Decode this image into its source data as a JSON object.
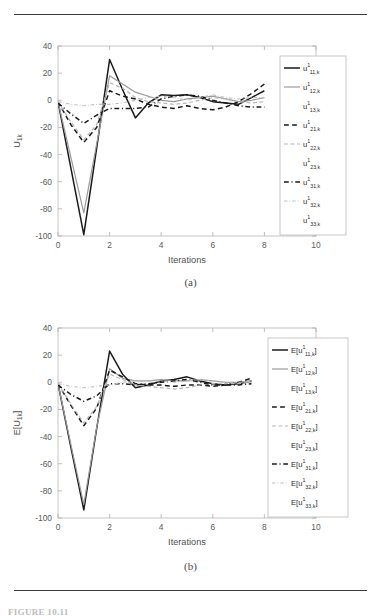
{
  "page": {
    "number_faint": "",
    "figure_caption_cut": "FIGURE 10.11"
  },
  "panels": [
    {
      "id": "a",
      "caption": "(a)"
    },
    {
      "id": "b",
      "caption": "(b)"
    }
  ],
  "chart_data": [
    {
      "type": "line",
      "panel": "a",
      "title": "",
      "xlabel": "Iterations",
      "ylabel": "U_1k",
      "ylabel_text": "U",
      "ylabel_sub": "1k",
      "xlim": [
        0,
        10
      ],
      "ylim": [
        -100,
        40
      ],
      "xticks": [
        0,
        2,
        4,
        6,
        8,
        10
      ],
      "xticklabels": [
        "0",
        "2",
        "4",
        "6",
        "8",
        "10"
      ],
      "yticks": [
        40,
        20,
        0,
        -20,
        -40,
        -60,
        -80,
        -100
      ],
      "yticklabels": [
        "40",
        "20",
        "0",
        "-20",
        "-40",
        "-60",
        "-80",
        "-100"
      ],
      "grid": false,
      "legend_position": "right-inside",
      "x": [
        0,
        0.5,
        1,
        1.5,
        2,
        2.5,
        3,
        3.5,
        4,
        4.5,
        5,
        5.5,
        6,
        6.5,
        7,
        7.5,
        8
      ],
      "series": [
        {
          "name": "u_11k",
          "base": "u",
          "sup": "1",
          "sub": "11,k",
          "style": "solid",
          "color": "#1a1a1a",
          "width": 1.5,
          "values": [
            -1,
            -50,
            -99,
            -35,
            30,
            8,
            -13,
            -2,
            4,
            3.5,
            4,
            2,
            -1,
            -2,
            -3,
            2,
            7
          ]
        },
        {
          "name": "u_12k",
          "base": "u",
          "sup": "1",
          "sub": "12,k",
          "style": "solid",
          "color": "#9a9a9a",
          "width": 1.2,
          "values": [
            -1,
            -42,
            -83,
            -32,
            18,
            12,
            6,
            3,
            0,
            -1,
            1,
            2,
            3,
            1,
            -1,
            0,
            2
          ]
        },
        {
          "name": "u_13k",
          "base": "u",
          "sup": "1",
          "sub": "13,k",
          "style": "none",
          "color": "#ffffff",
          "width": 0,
          "values": [
            0,
            0,
            0,
            0,
            0,
            0,
            0,
            0,
            0,
            0,
            0,
            0,
            0,
            0,
            0,
            0,
            0
          ]
        },
        {
          "name": "u_21k",
          "base": "u",
          "sup": "1",
          "sub": "21,k",
          "style": "dashed",
          "color": "#1a1a1a",
          "width": 1.5,
          "values": [
            -1,
            -18,
            -31,
            -20,
            7,
            3,
            1,
            -3,
            -5,
            -6,
            -4,
            -6,
            -7,
            -5,
            -1,
            5,
            12
          ]
        },
        {
          "name": "u_22k",
          "base": "u",
          "sup": "1",
          "sub": "22,k",
          "style": "dashed",
          "color": "#b6b6b6",
          "width": 1.2,
          "values": [
            -1,
            -16,
            -29,
            -18,
            13,
            9,
            2,
            -1,
            -2,
            -3,
            -2,
            0,
            2,
            1,
            -1,
            -2,
            -1
          ]
        },
        {
          "name": "u_23k",
          "base": "u",
          "sup": "1",
          "sub": "23,k",
          "style": "none",
          "color": "#ffffff",
          "width": 0,
          "values": [
            0,
            0,
            0,
            0,
            0,
            0,
            0,
            0,
            0,
            0,
            0,
            0,
            0,
            0,
            0,
            0,
            0
          ]
        },
        {
          "name": "u_31k",
          "base": "u",
          "sup": "1",
          "sub": "31,k",
          "style": "dashdot",
          "color": "#1a1a1a",
          "width": 1.5,
          "values": [
            -2,
            -10,
            -17,
            -11,
            -6,
            -6,
            -6,
            -5,
            1,
            3,
            4,
            3,
            0,
            -2,
            -4,
            -5,
            -5
          ]
        },
        {
          "name": "u_32k",
          "base": "u",
          "sup": "1",
          "sub": "32,k",
          "style": "dashdot",
          "color": "#c0c0c0",
          "width": 1.1,
          "values": [
            -1,
            -3,
            -4,
            -3,
            -3,
            -2,
            0,
            2,
            3,
            2,
            0,
            2,
            4,
            2,
            1,
            2,
            2
          ]
        },
        {
          "name": "u_33k",
          "base": "u",
          "sup": "1",
          "sub": "33,k",
          "style": "none",
          "color": "#ffffff",
          "width": 0,
          "values": [
            0,
            0,
            0,
            0,
            0,
            0,
            0,
            0,
            0,
            0,
            0,
            0,
            0,
            0,
            0,
            0,
            0
          ]
        }
      ]
    },
    {
      "type": "line",
      "panel": "b",
      "title": "",
      "xlabel": "Iterations",
      "ylabel": "E[U_1k]",
      "ylabel_text": "E[U",
      "ylabel_sub": "1k",
      "ylabel_tail": "]",
      "xlim": [
        0,
        10
      ],
      "ylim": [
        -100,
        40
      ],
      "xticks": [
        0,
        2,
        4,
        6,
        8,
        10
      ],
      "xticklabels": [
        "0",
        "2",
        "4",
        "6",
        "8",
        "10"
      ],
      "yticks": [
        40,
        20,
        0,
        -20,
        -40,
        -60,
        -80,
        -100
      ],
      "yticklabels": [
        "40",
        "20",
        "0",
        "-20",
        "-40",
        "-60",
        "-80",
        "-100"
      ],
      "grid": false,
      "legend_position": "right-inside",
      "x": [
        0,
        0.5,
        1,
        1.5,
        2,
        2.5,
        3,
        3.5,
        4,
        4.5,
        5,
        5.5,
        6,
        6.5,
        7,
        7.5
      ],
      "series": [
        {
          "name": "E_u_11k",
          "base": "E[u",
          "sup": "1",
          "sub": "11,k",
          "tail": "]",
          "style": "solid",
          "color": "#1a1a1a",
          "width": 1.5,
          "values": [
            -1,
            -48,
            -94,
            -34,
            23,
            6,
            -4,
            -2,
            1,
            2,
            4,
            1,
            -1,
            -2,
            -1,
            1
          ]
        },
        {
          "name": "E_u_12k",
          "base": "E[u",
          "sup": "1",
          "sub": "12,k",
          "tail": "]",
          "style": "solid",
          "color": "#9a9a9a",
          "width": 1.2,
          "values": [
            -1,
            -46,
            -90,
            -33,
            10,
            3,
            1,
            1,
            2,
            1,
            1,
            2,
            1,
            0,
            0,
            1
          ]
        },
        {
          "name": "E_u_13k",
          "base": "E[u",
          "sup": "1",
          "sub": "13,k",
          "tail": "]",
          "style": "none",
          "color": "#ffffff",
          "width": 0,
          "values": [
            0,
            0,
            0,
            0,
            0,
            0,
            0,
            0,
            0,
            0,
            0,
            0,
            0,
            0,
            0,
            0
          ]
        },
        {
          "name": "E_u_21k",
          "base": "E[u",
          "sup": "1",
          "sub": "21,k",
          "tail": "]",
          "style": "dashed",
          "color": "#1a1a1a",
          "width": 1.5,
          "values": [
            -1,
            -17,
            -32,
            -19,
            9,
            4,
            -1,
            -2,
            -2,
            -3,
            -2,
            -2,
            -3,
            -2,
            0,
            3
          ]
        },
        {
          "name": "E_u_22k",
          "base": "E[u",
          "sup": "1",
          "sub": "22,k",
          "tail": "]",
          "style": "dashed",
          "color": "#b6b6b6",
          "width": 1.2,
          "values": [
            -1,
            -16,
            -30,
            -18,
            6,
            2,
            -2,
            -3,
            -4,
            -5,
            -4,
            -2,
            -1,
            -1,
            -1,
            0
          ]
        },
        {
          "name": "E_u_23k",
          "base": "E[u",
          "sup": "1",
          "sub": "23,k",
          "tail": "]",
          "style": "none",
          "color": "#ffffff",
          "width": 0,
          "values": [
            0,
            0,
            0,
            0,
            0,
            0,
            0,
            0,
            0,
            0,
            0,
            0,
            0,
            0,
            0,
            0
          ]
        },
        {
          "name": "E_u_31k",
          "base": "E[u",
          "sup": "1",
          "sub": "31,k",
          "tail": "]",
          "style": "dashdot",
          "color": "#1a1a1a",
          "width": 1.5,
          "values": [
            -2,
            -9,
            -14,
            -10,
            -1,
            -1,
            -2,
            -1,
            0,
            1,
            2,
            0,
            -2,
            -2,
            -2,
            -1
          ]
        },
        {
          "name": "E_u_32k",
          "base": "E[u",
          "sup": "1",
          "sub": "32,k",
          "tail": "]",
          "style": "dashdot",
          "color": "#c0c0c0",
          "width": 1.1,
          "values": [
            -1,
            -3,
            -4,
            -3,
            -2,
            0,
            1,
            1,
            1,
            0,
            1,
            2,
            1,
            0,
            0,
            1
          ]
        },
        {
          "name": "E_u_33k",
          "base": "E[u",
          "sup": "1",
          "sub": "33,k",
          "tail": "]",
          "style": "none",
          "color": "#ffffff",
          "width": 0,
          "values": [
            0,
            0,
            0,
            0,
            0,
            0,
            0,
            0,
            0,
            0,
            0,
            0,
            0,
            0,
            0,
            0
          ]
        }
      ]
    }
  ]
}
